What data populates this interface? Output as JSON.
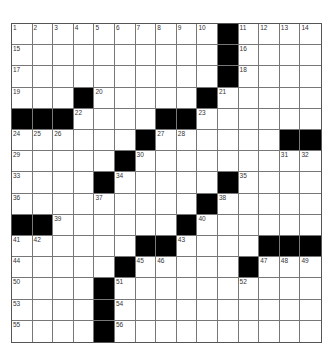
{
  "puzzle": {
    "rows": 15,
    "cols": 15,
    "colors": {
      "block": "#000000",
      "cell": "#ffffff",
      "line": "#777777"
    },
    "grid": [
      "..........#....",
      "..........#....",
      "..........#....",
      "...#.....#.....",
      "###....##......",
      "......#......##",
      ".....#.........",
      "....#.....#....",
      ".........#.....",
      "##......#......",
      "......##....###",
      ".....#.....#...",
      "....#..........",
      "....#..........",
      "....#.........."
    ],
    "numbers": [
      {
        "r": 0,
        "c": 0,
        "n": "1"
      },
      {
        "r": 0,
        "c": 1,
        "n": "2"
      },
      {
        "r": 0,
        "c": 2,
        "n": "3"
      },
      {
        "r": 0,
        "c": 3,
        "n": "4"
      },
      {
        "r": 0,
        "c": 4,
        "n": "5"
      },
      {
        "r": 0,
        "c": 5,
        "n": "6"
      },
      {
        "r": 0,
        "c": 6,
        "n": "7"
      },
      {
        "r": 0,
        "c": 7,
        "n": "8"
      },
      {
        "r": 0,
        "c": 8,
        "n": "9"
      },
      {
        "r": 0,
        "c": 9,
        "n": "10"
      },
      {
        "r": 0,
        "c": 11,
        "n": "11"
      },
      {
        "r": 0,
        "c": 12,
        "n": "12"
      },
      {
        "r": 0,
        "c": 13,
        "n": "13"
      },
      {
        "r": 0,
        "c": 14,
        "n": "14"
      },
      {
        "r": 1,
        "c": 0,
        "n": "15"
      },
      {
        "r": 1,
        "c": 11,
        "n": "16"
      },
      {
        "r": 2,
        "c": 0,
        "n": "17"
      },
      {
        "r": 2,
        "c": 11,
        "n": "18"
      },
      {
        "r": 3,
        "c": 0,
        "n": "19"
      },
      {
        "r": 3,
        "c": 4,
        "n": "20"
      },
      {
        "r": 3,
        "c": 10,
        "n": "21"
      },
      {
        "r": 4,
        "c": 3,
        "n": "22"
      },
      {
        "r": 4,
        "c": 9,
        "n": "23"
      },
      {
        "r": 5,
        "c": 0,
        "n": "24"
      },
      {
        "r": 5,
        "c": 1,
        "n": "25"
      },
      {
        "r": 5,
        "c": 2,
        "n": "26"
      },
      {
        "r": 5,
        "c": 7,
        "n": "27"
      },
      {
        "r": 5,
        "c": 8,
        "n": "28"
      },
      {
        "r": 6,
        "c": 0,
        "n": "29"
      },
      {
        "r": 6,
        "c": 6,
        "n": "30"
      },
      {
        "r": 6,
        "c": 13,
        "n": "31"
      },
      {
        "r": 6,
        "c": 14,
        "n": "32"
      },
      {
        "r": 7,
        "c": 0,
        "n": "33"
      },
      {
        "r": 7,
        "c": 5,
        "n": "34"
      },
      {
        "r": 7,
        "c": 11,
        "n": "35"
      },
      {
        "r": 8,
        "c": 0,
        "n": "36"
      },
      {
        "r": 8,
        "c": 4,
        "n": "37"
      },
      {
        "r": 8,
        "c": 10,
        "n": "38"
      },
      {
        "r": 9,
        "c": 2,
        "n": "39"
      },
      {
        "r": 9,
        "c": 9,
        "n": "40"
      },
      {
        "r": 10,
        "c": 0,
        "n": "41"
      },
      {
        "r": 10,
        "c": 1,
        "n": "42"
      },
      {
        "r": 10,
        "c": 8,
        "n": "43"
      },
      {
        "r": 11,
        "c": 0,
        "n": "44"
      },
      {
        "r": 11,
        "c": 6,
        "n": "45"
      },
      {
        "r": 11,
        "c": 7,
        "n": "46"
      },
      {
        "r": 11,
        "c": 12,
        "n": "47"
      },
      {
        "r": 11,
        "c": 13,
        "n": "48"
      },
      {
        "r": 11,
        "c": 14,
        "n": "49"
      },
      {
        "r": 12,
        "c": 0,
        "n": "50"
      },
      {
        "r": 12,
        "c": 5,
        "n": "51"
      },
      {
        "r": 12,
        "c": 11,
        "n": "52"
      },
      {
        "r": 13,
        "c": 0,
        "n": "53"
      },
      {
        "r": 13,
        "c": 5,
        "n": "54"
      },
      {
        "r": 14,
        "c": 0,
        "n": "55"
      },
      {
        "r": 14,
        "c": 5,
        "n": "56"
      }
    ]
  }
}
